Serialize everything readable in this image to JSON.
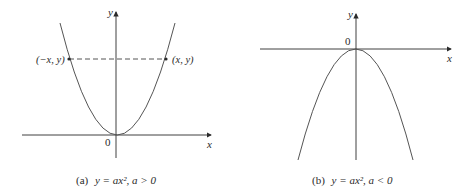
{
  "panels": [
    {
      "id": "a",
      "caption_prefix": "(a)",
      "caption_eq": "y = ax², a > 0",
      "axis_x_label": "x",
      "axis_y_label": "y",
      "origin_label": "0",
      "point_left_label": "(−x, y)",
      "point_right_label": "(x, y)",
      "curve": "upward parabola"
    },
    {
      "id": "b",
      "caption_prefix": "(b)",
      "caption_eq": "y = ax², a < 0",
      "axis_x_label": "x",
      "axis_y_label": "y",
      "origin_label": "0",
      "curve": "downward parabola"
    }
  ],
  "colors": {
    "ink": "#2a2a2a",
    "curve": "#555555",
    "background": "#ffffff"
  }
}
